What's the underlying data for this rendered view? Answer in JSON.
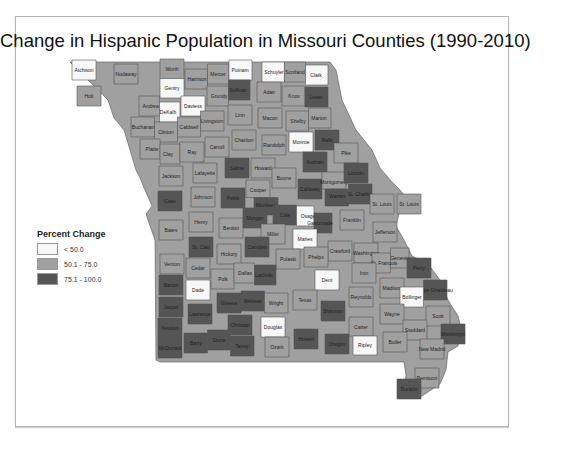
{
  "title": "Change in Hispanic Population in Missouri Counties (1990-2010)",
  "legend": {
    "title": "Percent Change",
    "classes": [
      {
        "label": "< 50.0",
        "color": "#f7f7f7"
      },
      {
        "label": "50.1 - 75.0",
        "color": "#a0a0a0"
      },
      {
        "label": "75.1 - 100.0",
        "color": "#555555"
      }
    ]
  },
  "colors": {
    "low": "#f7f7f7",
    "mid": "#a0a0a0",
    "high": "#555555"
  },
  "counties": [
    {
      "name": "Atchison",
      "class": "low",
      "x": 84,
      "y": 70
    },
    {
      "name": "Nodaway",
      "class": "mid",
      "x": 126,
      "y": 74
    },
    {
      "name": "Worth",
      "class": "mid",
      "x": 172,
      "y": 69
    },
    {
      "name": "Harrison",
      "class": "mid",
      "x": 197,
      "y": 79
    },
    {
      "name": "Mercer",
      "class": "mid",
      "x": 218,
      "y": 74
    },
    {
      "name": "Putnam",
      "class": "low",
      "x": 240,
      "y": 70
    },
    {
      "name": "Schuyler",
      "class": "low",
      "x": 274,
      "y": 72
    },
    {
      "name": "Scotland",
      "class": "mid",
      "x": 295,
      "y": 72
    },
    {
      "name": "Clark",
      "class": "low",
      "x": 316,
      "y": 75
    },
    {
      "name": "Holt",
      "class": "mid",
      "x": 89,
      "y": 96
    },
    {
      "name": "Andrew",
      "class": "mid",
      "x": 151,
      "y": 106
    },
    {
      "name": "Gentry",
      "class": "low",
      "x": 172,
      "y": 88
    },
    {
      "name": "DeKalb",
      "class": "low",
      "x": 168,
      "y": 112
    },
    {
      "name": "Daviess",
      "class": "low",
      "x": 193,
      "y": 106
    },
    {
      "name": "Grundy",
      "class": "mid",
      "x": 219,
      "y": 96
    },
    {
      "name": "Sullivan",
      "class": "high",
      "x": 238,
      "y": 90
    },
    {
      "name": "Adair",
      "class": "mid",
      "x": 269,
      "y": 92
    },
    {
      "name": "Knox",
      "class": "mid",
      "x": 294,
      "y": 96
    },
    {
      "name": "Lewis",
      "class": "high",
      "x": 316,
      "y": 97
    },
    {
      "name": "Buchanan",
      "class": "mid",
      "x": 143,
      "y": 127
    },
    {
      "name": "Clinton",
      "class": "mid",
      "x": 166,
      "y": 132
    },
    {
      "name": "Caldwell",
      "class": "mid",
      "x": 189,
      "y": 127
    },
    {
      "name": "Livingston",
      "class": "mid",
      "x": 212,
      "y": 121
    },
    {
      "name": "Linn",
      "class": "mid",
      "x": 240,
      "y": 115
    },
    {
      "name": "Macon",
      "class": "mid",
      "x": 270,
      "y": 118
    },
    {
      "name": "Shelby",
      "class": "mid",
      "x": 298,
      "y": 121
    },
    {
      "name": "Marion",
      "class": "mid",
      "x": 319,
      "y": 118
    },
    {
      "name": "Platte",
      "class": "mid",
      "x": 152,
      "y": 149
    },
    {
      "name": "Clay",
      "class": "mid",
      "x": 168,
      "y": 154
    },
    {
      "name": "Ray",
      "class": "mid",
      "x": 192,
      "y": 152
    },
    {
      "name": "Carroll",
      "class": "mid",
      "x": 217,
      "y": 147
    },
    {
      "name": "Chariton",
      "class": "mid",
      "x": 244,
      "y": 140
    },
    {
      "name": "Randolph",
      "class": "mid",
      "x": 274,
      "y": 145
    },
    {
      "name": "Monroe",
      "class": "low",
      "x": 301,
      "y": 142
    },
    {
      "name": "Ralls",
      "class": "high",
      "x": 327,
      "y": 140
    },
    {
      "name": "Pike",
      "class": "mid",
      "x": 346,
      "y": 153
    },
    {
      "name": "Jackson",
      "class": "mid",
      "x": 171,
      "y": 176
    },
    {
      "name": "Lafayette",
      "class": "mid",
      "x": 205,
      "y": 173
    },
    {
      "name": "Saline",
      "class": "high",
      "x": 237,
      "y": 168
    },
    {
      "name": "Howard",
      "class": "mid",
      "x": 263,
      "y": 168
    },
    {
      "name": "Boone",
      "class": "mid",
      "x": 284,
      "y": 178
    },
    {
      "name": "Audrain",
      "class": "high",
      "x": 315,
      "y": 162
    },
    {
      "name": "Callaway",
      "class": "high",
      "x": 310,
      "y": 189
    },
    {
      "name": "Montgomery",
      "class": "mid",
      "x": 334,
      "y": 182
    },
    {
      "name": "Lincoln",
      "class": "high",
      "x": 356,
      "y": 173
    },
    {
      "name": "Warren",
      "class": "high",
      "x": 337,
      "y": 196
    },
    {
      "name": "St. Charles",
      "class": "high",
      "x": 360,
      "y": 194
    },
    {
      "name": "St. Louis",
      "class": "mid",
      "x": 382,
      "y": 204
    },
    {
      "name": "St. Louis City",
      "display": "St. Louis",
      "class": "mid",
      "x": 409,
      "y": 204
    },
    {
      "name": "Cass",
      "class": "high",
      "x": 170,
      "y": 201
    },
    {
      "name": "Johnson",
      "class": "mid",
      "x": 203,
      "y": 197
    },
    {
      "name": "Pettis",
      "class": "high",
      "x": 233,
      "y": 198
    },
    {
      "name": "Cooper",
      "class": "mid",
      "x": 258,
      "y": 190
    },
    {
      "name": "Moniteau",
      "class": "high",
      "x": 266,
      "y": 205
    },
    {
      "name": "Cole",
      "class": "high",
      "x": 285,
      "y": 215
    },
    {
      "name": "Osage",
      "class": "low",
      "x": 308,
      "y": 216
    },
    {
      "name": "Gasconade",
      "class": "high",
      "x": 320,
      "y": 223
    },
    {
      "name": "Franklin",
      "class": "mid",
      "x": 352,
      "y": 220
    },
    {
      "name": "Jefferson",
      "class": "mid",
      "x": 385,
      "y": 232
    },
    {
      "name": "Bates",
      "class": "mid",
      "x": 171,
      "y": 230
    },
    {
      "name": "Henry",
      "class": "mid",
      "x": 201,
      "y": 222
    },
    {
      "name": "Benton",
      "class": "mid",
      "x": 231,
      "y": 228
    },
    {
      "name": "Morgan",
      "class": "high",
      "x": 255,
      "y": 218
    },
    {
      "name": "Miller",
      "class": "mid",
      "x": 273,
      "y": 234
    },
    {
      "name": "Maries",
      "class": "low",
      "x": 305,
      "y": 239
    },
    {
      "name": "Crawford",
      "class": "mid",
      "x": 340,
      "y": 251
    },
    {
      "name": "Washington",
      "class": "mid",
      "x": 366,
      "y": 253
    },
    {
      "name": "Ste. Genevieve",
      "class": "mid",
      "x": 397,
      "y": 258
    },
    {
      "name": "St. Francois",
      "class": "mid",
      "x": 384,
      "y": 263
    },
    {
      "name": "Perry",
      "class": "high",
      "x": 419,
      "y": 268
    },
    {
      "name": "St. Clair",
      "class": "high",
      "x": 201,
      "y": 247
    },
    {
      "name": "Hickory",
      "class": "mid",
      "x": 229,
      "y": 254
    },
    {
      "name": "Camden",
      "class": "high",
      "x": 257,
      "y": 247
    },
    {
      "name": "Pulaski",
      "class": "mid",
      "x": 288,
      "y": 259
    },
    {
      "name": "Phelps",
      "class": "mid",
      "x": 316,
      "y": 257
    },
    {
      "name": "Dent",
      "class": "low",
      "x": 327,
      "y": 280
    },
    {
      "name": "Iron",
      "class": "mid",
      "x": 364,
      "y": 273
    },
    {
      "name": "Madison",
      "class": "mid",
      "x": 392,
      "y": 288
    },
    {
      "name": "Cape Girardeau",
      "class": "high",
      "x": 435,
      "y": 290
    },
    {
      "name": "Bollinger",
      "class": "low",
      "x": 412,
      "y": 297
    },
    {
      "name": "Vernon",
      "class": "mid",
      "x": 172,
      "y": 264
    },
    {
      "name": "Cedar",
      "class": "mid",
      "x": 198,
      "y": 268
    },
    {
      "name": "Polk",
      "class": "mid",
      "x": 223,
      "y": 279
    },
    {
      "name": "Dallas",
      "class": "mid",
      "x": 245,
      "y": 273
    },
    {
      "name": "Laclede",
      "class": "high",
      "x": 264,
      "y": 275
    },
    {
      "name": "Texas",
      "class": "mid",
      "x": 305,
      "y": 300
    },
    {
      "name": "Reynolds",
      "class": "mid",
      "x": 361,
      "y": 297
    },
    {
      "name": "Wayne",
      "class": "mid",
      "x": 392,
      "y": 314
    },
    {
      "name": "Barton",
      "class": "high",
      "x": 171,
      "y": 285
    },
    {
      "name": "Dade",
      "class": "low",
      "x": 198,
      "y": 290
    },
    {
      "name": "Jasper",
      "class": "high",
      "x": 171,
      "y": 307
    },
    {
      "name": "Lawrence",
      "class": "high",
      "x": 200,
      "y": 314
    },
    {
      "name": "Greene",
      "class": "high",
      "x": 229,
      "y": 303
    },
    {
      "name": "Webster",
      "class": "high",
      "x": 253,
      "y": 301
    },
    {
      "name": "Wright",
      "class": "mid",
      "x": 276,
      "y": 303
    },
    {
      "name": "Shannon",
      "class": "high",
      "x": 333,
      "y": 311
    },
    {
      "name": "Carter",
      "class": "mid",
      "x": 361,
      "y": 327
    },
    {
      "name": "Scott",
      "class": "mid",
      "x": 438,
      "y": 316
    },
    {
      "name": "Stoddard",
      "class": "mid",
      "x": 415,
      "y": 330
    },
    {
      "name": "Mississippi",
      "class": "high",
      "x": 453,
      "y": 334
    },
    {
      "name": "Newton",
      "class": "high",
      "x": 170,
      "y": 328
    },
    {
      "name": "Christian",
      "class": "high",
      "x": 240,
      "y": 325
    },
    {
      "name": "Douglas",
      "class": "low",
      "x": 273,
      "y": 327
    },
    {
      "name": "Barry",
      "class": "high",
      "x": 196,
      "y": 343
    },
    {
      "name": "Stone",
      "class": "high",
      "x": 219,
      "y": 340
    },
    {
      "name": "Taney",
      "class": "high",
      "x": 242,
      "y": 346
    },
    {
      "name": "Ozark",
      "class": "mid",
      "x": 277,
      "y": 347
    },
    {
      "name": "Howell",
      "class": "high",
      "x": 306,
      "y": 339
    },
    {
      "name": "Oregon",
      "class": "high",
      "x": 337,
      "y": 344
    },
    {
      "name": "Ripley",
      "class": "low",
      "x": 365,
      "y": 345
    },
    {
      "name": "Butler",
      "class": "mid",
      "x": 395,
      "y": 342
    },
    {
      "name": "New Madrid",
      "class": "mid",
      "x": 432,
      "y": 349
    },
    {
      "name": "McDonald",
      "class": "high",
      "x": 170,
      "y": 348
    },
    {
      "name": "Pemiscot",
      "class": "mid",
      "x": 427,
      "y": 378
    },
    {
      "name": "Dunklin",
      "class": "high",
      "x": 409,
      "y": 389
    }
  ]
}
